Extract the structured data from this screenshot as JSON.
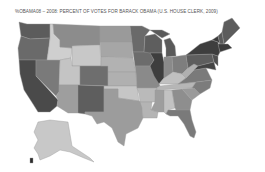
{
  "title": "%OBAMA08 – 2008: PERCENT OF VOTES FOR BARACK OBAMA (U.S. HOUSE CLERK, 2009)",
  "map": {
    "type": "choropleth",
    "region": "United States (by state)",
    "variable": "%OBAMA08",
    "palette": "grayscale (darker = higher percent)",
    "states": [
      {
        "id": "WA",
        "shade": "#5c5c5c"
      },
      {
        "id": "OR",
        "shade": "#6a6a6a"
      },
      {
        "id": "CA",
        "shade": "#4a4a4a"
      },
      {
        "id": "NV",
        "shade": "#7a7a7a"
      },
      {
        "id": "ID",
        "shade": "#cfcfcf"
      },
      {
        "id": "MT",
        "shade": "#8c8c8c"
      },
      {
        "id": "WY",
        "shade": "#c8c8c8"
      },
      {
        "id": "UT",
        "shade": "#c4c4c4"
      },
      {
        "id": "AZ",
        "shade": "#9e9e9e"
      },
      {
        "id": "CO",
        "shade": "#6e6e6e"
      },
      {
        "id": "NM",
        "shade": "#5e5e5e"
      },
      {
        "id": "ND",
        "shade": "#9a9a9a"
      },
      {
        "id": "SD",
        "shade": "#a6a6a6"
      },
      {
        "id": "NE",
        "shade": "#b2b2b2"
      },
      {
        "id": "KS",
        "shade": "#b0b0b0"
      },
      {
        "id": "OK",
        "shade": "#c6c6c6"
      },
      {
        "id": "TX",
        "shade": "#9c9c9c"
      },
      {
        "id": "MN",
        "shade": "#6a6a6a"
      },
      {
        "id": "IA",
        "shade": "#6c6c6c"
      },
      {
        "id": "MO",
        "shade": "#8a8a8a"
      },
      {
        "id": "AR",
        "shade": "#bababa"
      },
      {
        "id": "LA",
        "shade": "#b4b4b4"
      },
      {
        "id": "WI",
        "shade": "#5e5e5e"
      },
      {
        "id": "IL",
        "shade": "#3e3e3e"
      },
      {
        "id": "MI",
        "shade": "#5a5a5a"
      },
      {
        "id": "IN",
        "shade": "#8a8a8a"
      },
      {
        "id": "OH",
        "shade": "#7e7e7e"
      },
      {
        "id": "KY",
        "shade": "#c0c0c0"
      },
      {
        "id": "TN",
        "shade": "#b6b6b6"
      },
      {
        "id": "MS",
        "shade": "#9e9e9e"
      },
      {
        "id": "AL",
        "shade": "#c2c2c2"
      },
      {
        "id": "GA",
        "shade": "#8e8e8e"
      },
      {
        "id": "FL",
        "shade": "#7a7a7a"
      },
      {
        "id": "SC",
        "shade": "#9a9a9a"
      },
      {
        "id": "NC",
        "shade": "#7c7c7c"
      },
      {
        "id": "VA",
        "shade": "#7a7a7a"
      },
      {
        "id": "WV",
        "shade": "#b0b0b0"
      },
      {
        "id": "PA",
        "shade": "#5e5e5e"
      },
      {
        "id": "NY",
        "shade": "#3e3e3e"
      },
      {
        "id": "VT",
        "shade": "#3a3a3a"
      },
      {
        "id": "NH",
        "shade": "#5a5a5a"
      },
      {
        "id": "ME",
        "shade": "#5c5c5c"
      },
      {
        "id": "MA",
        "shade": "#3c3c3c"
      },
      {
        "id": "NJ",
        "shade": "#505050"
      },
      {
        "id": "MD",
        "shade": "#444444"
      },
      {
        "id": "AK",
        "shade": "#c8c8c8"
      },
      {
        "id": "HI",
        "shade": "#2c2c2c"
      }
    ]
  }
}
